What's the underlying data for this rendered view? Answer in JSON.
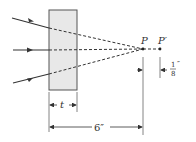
{
  "diagram": {
    "slab_label": "t",
    "point_p": "P",
    "point_p_prime": "P′",
    "distance_label": "6″",
    "shift_numerator": "1",
    "shift_denominator": "8",
    "shift_unit": "″",
    "colors": {
      "line": "#333333",
      "slab_fill": "#e8e8e8",
      "slab_stroke": "#555555"
    }
  }
}
